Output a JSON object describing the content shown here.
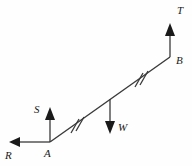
{
  "figure": {
    "background_color": "#fefefe",
    "stroke_color": "#3a3a3a",
    "label_color": "#1a1a1a",
    "points": [
      {
        "id": "A",
        "label": "A",
        "x": 50,
        "y": 142,
        "label_x": 44,
        "label_y": 149
      },
      {
        "id": "B",
        "label": "B",
        "x": 170,
        "y": 57,
        "label_x": 176,
        "label_y": 57
      }
    ],
    "segment": {
      "name": "segment-ab",
      "from": "A",
      "to": "B",
      "x1": 50,
      "y1": 142,
      "x2": 170,
      "y2": 57,
      "tick_marks": [
        {
          "name": "tick-mark-lower",
          "x": 76,
          "y": 124,
          "count": 2
        },
        {
          "name": "tick-mark-upper",
          "x": 140,
          "y": 78,
          "count": 2
        }
      ]
    },
    "vectors": [
      {
        "id": "R",
        "label": "R",
        "direction": "left",
        "origin_x": 50,
        "origin_y": 142,
        "tip_x": 10,
        "tip_y": 142,
        "label_x": 6,
        "label_y": 152
      },
      {
        "id": "S",
        "label": "S",
        "direction": "up",
        "origin_x": 50,
        "origin_y": 142,
        "tip_x": 50,
        "tip_y": 108,
        "label_x": 35,
        "label_y": 106
      },
      {
        "id": "W",
        "label": "W",
        "direction": "down",
        "origin_x": 110,
        "origin_y": 99,
        "tip_x": 110,
        "tip_y": 133,
        "label_x": 118,
        "label_y": 122
      },
      {
        "id": "T",
        "label": "T",
        "direction": "up",
        "origin_x": 170,
        "origin_y": 57,
        "tip_x": 170,
        "tip_y": 24,
        "label_x": 177,
        "label_y": 8
      }
    ]
  }
}
